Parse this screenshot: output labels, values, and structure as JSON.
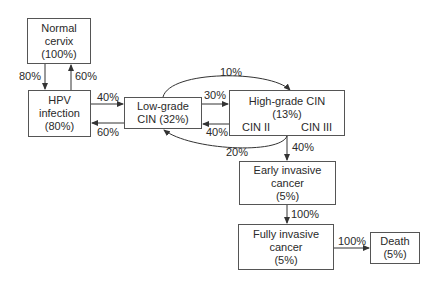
{
  "nodes": {
    "normal": {
      "lines": [
        "Normal",
        "cervix",
        "(100%)"
      ]
    },
    "hpv": {
      "lines": [
        "HPV",
        "infection",
        "(80%)"
      ]
    },
    "low": {
      "lines": [
        "Low-grade",
        "CIN (32%)"
      ]
    },
    "high": {
      "lines": [
        "High-grade CIN",
        "(13%)"
      ],
      "sub_left": "CIN II",
      "sub_right": "CIN III"
    },
    "early": {
      "lines": [
        "Early invasive",
        "cancer",
        "(5%)"
      ]
    },
    "fully": {
      "lines": [
        "Fully invasive",
        "cancer",
        "(5%)"
      ]
    },
    "death": {
      "lines": [
        "Death",
        "(5%)"
      ]
    }
  },
  "edges": {
    "normal_to_hpv": "80%",
    "hpv_to_normal": "60%",
    "hpv_to_low": "40%",
    "low_to_hpv": "60%",
    "low_to_high": "30%",
    "high_to_low": "40%",
    "low_to_high_arc": "10%",
    "high_to_low_arc": "20%",
    "high_to_early": "40%",
    "early_to_fully": "100%",
    "fully_to_death": "100%"
  },
  "colors": {
    "line": "#333333",
    "border": "#555555",
    "text": "#2a2a2a"
  }
}
